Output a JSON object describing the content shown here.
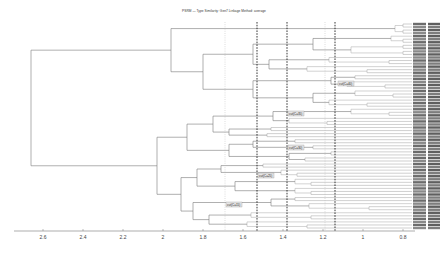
{
  "chart_data": {
    "type": "dendrogram",
    "title": "PSRM — Type Similarity: Gen7  Linkage Method: average",
    "orientation": "horizontal (root left, leaves right)",
    "xlabel": "",
    "ylabel": "",
    "xlim": [
      2.75,
      0.75
    ],
    "x_ticks": [
      2.6,
      2.4,
      2.2,
      2,
      1.8,
      1.6,
      1.4,
      1.2,
      1,
      0.8
    ],
    "x_tick_labels": [
      "2.6",
      "2.4",
      "2.2",
      "2",
      "1.8",
      "1.6",
      "1.4",
      "1.2",
      "1",
      "0.8"
    ],
    "cut_lines": [
      {
        "x": 1.69,
        "style": "dotted-light"
      },
      {
        "x": 1.53,
        "style": "dashed-bold"
      },
      {
        "x": 1.38,
        "style": "dashed-bold"
      },
      {
        "x": 1.19,
        "style": "dotted-light"
      },
      {
        "x": 1.14,
        "style": "dashed-bold"
      }
    ],
    "cluster_labels": [
      {
        "text": "cut(C=40)",
        "x": 1.13,
        "y_px": 84
      },
      {
        "text": "cut(C=35)",
        "x": 1.38,
        "y_px": 114
      },
      {
        "text": "cut(C=30)",
        "x": 1.38,
        "y_px": 148
      },
      {
        "text": "cut(C=25)",
        "x": 1.53,
        "y_px": 176
      },
      {
        "text": "cut(C=15)",
        "x": 1.69,
        "y_px": 205
      }
    ],
    "merges": [
      {
        "name": "root",
        "height": 2.66,
        "children": [
          "A",
          "B"
        ]
      },
      {
        "name": "A",
        "height": 1.96,
        "children": [
          "A1",
          "A2"
        ]
      },
      {
        "name": "A1",
        "height": 0.78,
        "note": "top leaf group"
      },
      {
        "name": "A2",
        "height": 1.8,
        "children": [
          "A2a",
          "A2b"
        ]
      },
      {
        "name": "B",
        "height": 2.03,
        "children": [
          "B1",
          "B2"
        ]
      },
      {
        "name": "B1",
        "height": 1.88,
        "children": [
          "B1a",
          "B1b"
        ]
      },
      {
        "name": "B2",
        "height": 1.91,
        "children": [
          "B2a",
          "B2b"
        ]
      }
    ],
    "leaf_count": 68,
    "legend": null,
    "grid": false
  },
  "leaf_labels_note": "Leaf labels are rendered in two narrow columns at the right edge and are not legible at this resolution."
}
